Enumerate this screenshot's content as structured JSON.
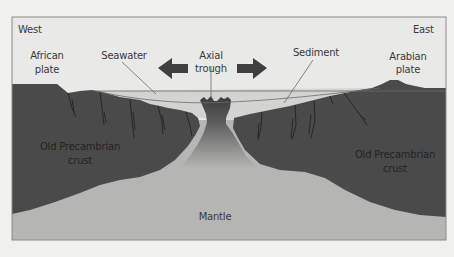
{
  "diagram": {
    "type": "geological cross-section",
    "orientation": {
      "left": "West",
      "right": "East"
    },
    "labels": {
      "west": "West",
      "east": "East",
      "african_plate_line1": "African",
      "african_plate_line2": "plate",
      "arabian_plate_line1": "Arabian",
      "arabian_plate_line2": "plate",
      "seawater": "Seawater",
      "axial_trough_line1": "Axial",
      "axial_trough_line2": "trough",
      "sediment": "Sediment",
      "crust_west_line1": "Old Precambrian",
      "crust_west_line2": "crust",
      "crust_east_line1": "Old Precambrian",
      "crust_east_line2": "crust",
      "mantle": "Mantle"
    },
    "arrows": [
      {
        "name": "spreading-arrow-west",
        "direction": "left"
      },
      {
        "name": "spreading-arrow-east",
        "direction": "right"
      }
    ],
    "colors": {
      "page_background": "#f1f1ef",
      "frame_background": "#e9e9e7",
      "frame_border": "#8a8a8a",
      "crust": "#4a4a4a",
      "mantle": "#b5b5b3",
      "seawater": "#d3d3d1",
      "arrow": "#3f3f3f",
      "leader_line": "#6a6a6a",
      "label_text": "#3a3a3a"
    }
  }
}
